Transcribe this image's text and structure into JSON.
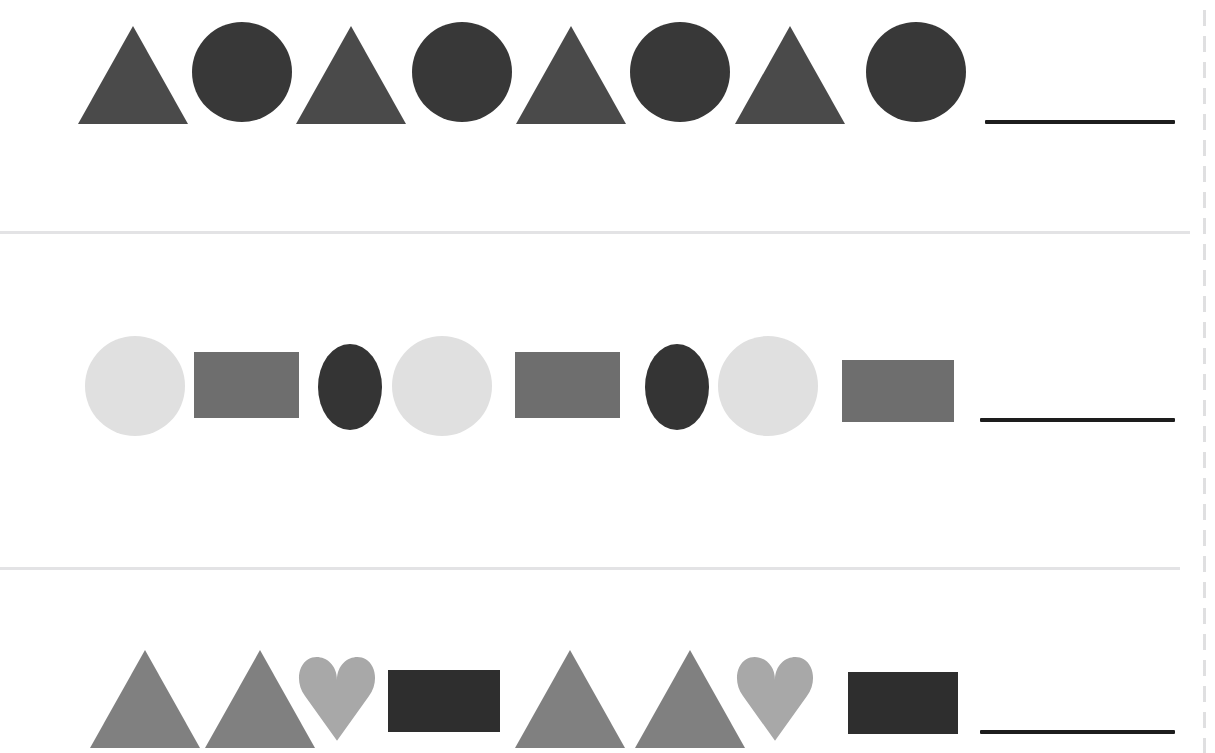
{
  "worksheet": {
    "title": "Shape Pattern Completion Worksheet",
    "background_color": "#ffffff",
    "width": 1215,
    "height": 753,
    "divider_color": "#e3e3e5",
    "answer_line_color": "#1d1d1d",
    "edge_dash_color": "#96969b"
  },
  "palette": {
    "dark_gray": "#4a4a4a",
    "near_black_circle": "#383838",
    "light_gray": "#e0e0e0",
    "medium_gray": "#6e6e6e",
    "dark_ellipse": "#343434",
    "mid_triangle": "#808080",
    "heart_gray": "#a8a8a8",
    "black_rect": "#2e2e2e"
  },
  "dividers": [
    {
      "name": "divider-1",
      "y": 231,
      "width": 1190
    },
    {
      "name": "divider-2",
      "y": 567,
      "width": 1180
    }
  ],
  "edge_dash": {
    "name": "right-edge-dashed-rule",
    "x": 1203
  },
  "rows": [
    {
      "id": "row-1",
      "label": "Pattern 1",
      "pattern_unit": [
        "triangle",
        "circle"
      ],
      "repeats": 4,
      "shapes": [
        {
          "type": "triangle",
          "color": "#4a4a4a",
          "x": 78,
          "y": 26,
          "w": 110,
          "h": 98
        },
        {
          "type": "circle",
          "color": "#383838",
          "x": 192,
          "y": 22,
          "w": 100,
          "h": 100
        },
        {
          "type": "triangle",
          "color": "#4a4a4a",
          "x": 296,
          "y": 26,
          "w": 110,
          "h": 98
        },
        {
          "type": "circle",
          "color": "#383838",
          "x": 412,
          "y": 22,
          "w": 100,
          "h": 100
        },
        {
          "type": "triangle",
          "color": "#4a4a4a",
          "x": 516,
          "y": 26,
          "w": 110,
          "h": 98
        },
        {
          "type": "circle",
          "color": "#383838",
          "x": 630,
          "y": 22,
          "w": 100,
          "h": 100
        },
        {
          "type": "triangle",
          "color": "#4a4a4a",
          "x": 735,
          "y": 26,
          "w": 110,
          "h": 98
        },
        {
          "type": "circle",
          "color": "#383838",
          "x": 866,
          "y": 22,
          "w": 100,
          "h": 100
        }
      ],
      "answer_line": {
        "x": 985,
        "y": 120,
        "w": 190
      }
    },
    {
      "id": "row-2",
      "label": "Pattern 2",
      "pattern_unit": [
        "circle",
        "rectangle",
        "ellipse"
      ],
      "repeats": 3,
      "shapes": [
        {
          "type": "circle",
          "color": "#e0e0e0",
          "x": 85,
          "y": 336,
          "w": 100,
          "h": 100
        },
        {
          "type": "rectangle",
          "color": "#6e6e6e",
          "x": 194,
          "y": 352,
          "w": 105,
          "h": 66
        },
        {
          "type": "ellipse",
          "color": "#343434",
          "x": 318,
          "y": 344,
          "w": 64,
          "h": 86
        },
        {
          "type": "circle",
          "color": "#e0e0e0",
          "x": 392,
          "y": 336,
          "w": 100,
          "h": 100
        },
        {
          "type": "rectangle",
          "color": "#6e6e6e",
          "x": 515,
          "y": 352,
          "w": 105,
          "h": 66
        },
        {
          "type": "ellipse",
          "color": "#343434",
          "x": 645,
          "y": 344,
          "w": 64,
          "h": 86
        },
        {
          "type": "circle",
          "color": "#e0e0e0",
          "x": 718,
          "y": 336,
          "w": 100,
          "h": 100
        },
        {
          "type": "rectangle",
          "color": "#6e6e6e",
          "x": 842,
          "y": 360,
          "w": 112,
          "h": 62
        }
      ],
      "answer_line": {
        "x": 980,
        "y": 418,
        "w": 195
      }
    },
    {
      "id": "row-3",
      "label": "Pattern 3",
      "pattern_unit": [
        "triangle",
        "triangle",
        "heart",
        "rectangle"
      ],
      "repeats": 2,
      "shapes": [
        {
          "type": "triangle",
          "color": "#808080",
          "x": 90,
          "y": 650,
          "w": 110,
          "h": 98
        },
        {
          "type": "triangle",
          "color": "#808080",
          "x": 205,
          "y": 650,
          "w": 110,
          "h": 98
        },
        {
          "type": "heart",
          "color": "#a8a8a8",
          "x": 297,
          "y": 650,
          "w": 80,
          "h": 92
        },
        {
          "type": "rectangle",
          "color": "#2e2e2e",
          "x": 388,
          "y": 670,
          "w": 112,
          "h": 62
        },
        {
          "type": "triangle",
          "color": "#808080",
          "x": 515,
          "y": 650,
          "w": 110,
          "h": 98
        },
        {
          "type": "triangle",
          "color": "#808080",
          "x": 635,
          "y": 650,
          "w": 110,
          "h": 98
        },
        {
          "type": "heart",
          "color": "#a8a8a8",
          "x": 735,
          "y": 650,
          "w": 80,
          "h": 92
        },
        {
          "type": "rectangle",
          "color": "#2e2e2e",
          "x": 848,
          "y": 672,
          "w": 110,
          "h": 62
        }
      ],
      "answer_line": {
        "x": 980,
        "y": 730,
        "w": 195
      }
    }
  ]
}
